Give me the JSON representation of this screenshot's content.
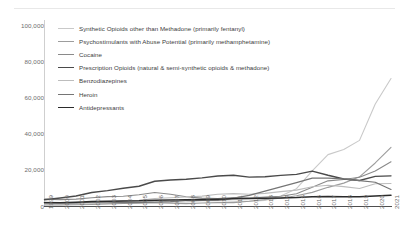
{
  "chart_data": {
    "type": "line",
    "title": "",
    "xlabel": "",
    "ylabel": "",
    "ylim": [
      0,
      100000
    ],
    "yticks": [
      "0",
      "20,000",
      "40,000",
      "60,000",
      "80,000",
      "100,000"
    ],
    "ytick_values": [
      0,
      20000,
      40000,
      60000,
      80000,
      100000
    ],
    "grid": false,
    "legend_position": "top-left inside plot",
    "x": [
      1999,
      2000,
      2001,
      2002,
      2003,
      2004,
      2005,
      2006,
      2007,
      2008,
      2009,
      2010,
      2011,
      2012,
      2013,
      2014,
      2015,
      2016,
      2017,
      2018,
      2019,
      2020,
      2021
    ],
    "categories": [
      "1999",
      "2000",
      "2001",
      "2002",
      "2003",
      "2004",
      "2005",
      "2006",
      "2007",
      "2008",
      "2009",
      "2010",
      "2011",
      "2012",
      "2013",
      "2014",
      "2015",
      "2016",
      "2017",
      "2018",
      "2019",
      "2020",
      "2021"
    ],
    "series": [
      {
        "name": "Synthetic Opioids other than Methadone (primarily fentanyl)",
        "color": "#c9c9c9",
        "width": 1.1,
        "values": [
          730,
          782,
          957,
          1295,
          1400,
          1664,
          1742,
          2707,
          2213,
          2306,
          2946,
          3007,
          2666,
          2628,
          3105,
          5544,
          9580,
          19413,
          28466,
          31335,
          36359,
          56516,
          70601
        ]
      },
      {
        "name": "Psychostimulants with Abuse Potential (primarily methamphetamine)",
        "color": "#9d9d9d",
        "width": 1.1,
        "values": [
          547,
          573,
          708,
          861,
          1152,
          1371,
          1608,
          1791,
          1587,
          1304,
          1632,
          1854,
          1887,
          2635,
          3627,
          4298,
          5716,
          7542,
          10333,
          12676,
          16167,
          23837,
          32537
        ]
      },
      {
        "name": "Cocaine",
        "color": "#8a8a8a",
        "width": 1.1,
        "values": [
          3822,
          3544,
          3833,
          4599,
          5198,
          5443,
          6208,
          7448,
          6512,
          5129,
          4350,
          4183,
          4681,
          4404,
          4944,
          5415,
          6784,
          10375,
          13942,
          14666,
          15883,
          19447,
          24486
        ]
      },
      {
        "name": "Prescription Opioids (natural & semi-synthetic opioids & methadone)",
        "color": "#4a4a4a",
        "width": 1.4,
        "values": [
          3442,
          4400,
          5528,
          7456,
          8517,
          9857,
          10928,
          13723,
          14408,
          14800,
          15597,
          16651,
          17023,
          16007,
          16235,
          16941,
          17536,
          19354,
          17029,
          14975,
          14139,
          16416,
          16706
        ]
      },
      {
        "name": "Benzodiazepines",
        "color": "#bdbdbd",
        "width": 1.1,
        "values": [
          1135,
          1298,
          1517,
          1939,
          2272,
          2692,
          3134,
          4156,
          4538,
          4986,
          5457,
          6497,
          6872,
          6524,
          6973,
          7945,
          8791,
          10684,
          11537,
          10724,
          9711,
          12290,
          12499
        ]
      },
      {
        "name": "Heroin",
        "color": "#757575",
        "width": 1.2,
        "values": [
          1960,
          1842,
          1779,
          2089,
          2080,
          1878,
          2009,
          2088,
          2399,
          3041,
          3278,
          3036,
          4397,
          5925,
          8257,
          10574,
          12989,
          15469,
          15482,
          14996,
          14019,
          13165,
          9173
        ]
      },
      {
        "name": "Antidepressants",
        "color": "#2b2b2b",
        "width": 1.5,
        "values": [
          1749,
          1862,
          2068,
          2450,
          2608,
          2784,
          2851,
          3205,
          3372,
          3524,
          3597,
          3799,
          4080,
          4162,
          4303,
          4401,
          4657,
          5142,
          5269,
          5064,
          5175,
          5597,
          5981
        ]
      }
    ]
  },
  "legend": {
    "items": [
      {
        "label": "Synthetic Opioids other than Methadone (primarily fentanyl)"
      },
      {
        "label": "Psychostimulants with Abuse Potential (primarily methamphetamine)"
      },
      {
        "label": "Cocaine"
      },
      {
        "label": "Prescription Opioids (natural & semi-synthetic opioids & methadone)"
      },
      {
        "label": "Benzodiazepines"
      },
      {
        "label": "Heroin"
      },
      {
        "label": "Antidepressants"
      }
    ]
  },
  "axis": {
    "y_color": "#cfcfcf",
    "x_color": "#4f4f4f",
    "tick_text_color": "#6d6d6d"
  }
}
